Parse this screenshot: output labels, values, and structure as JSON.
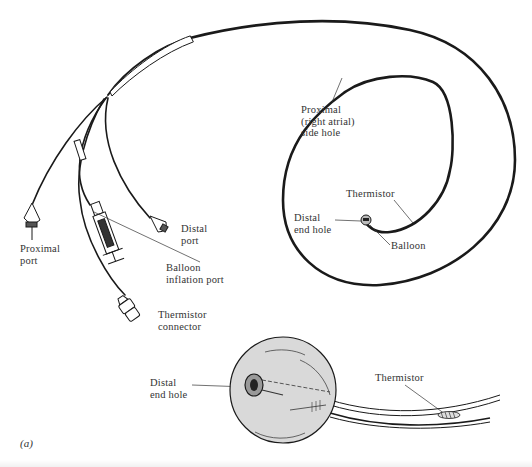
{
  "figure": {
    "label": "(a)"
  },
  "labels": {
    "proximal_port": "Proximal\nport",
    "distal_port": "Distal\nport",
    "balloon_inflation_port": "Balloon\ninflation port",
    "thermistor_connector": "Thermistor\nconnector",
    "proximal_side_hole": "Proximal\n(right atrial)\nside hole",
    "thermistor_top": "Thermistor",
    "distal_end_hole_top": "Distal\nend hole",
    "balloon": "Balloon",
    "distal_end_hole_detail": "Distal\nend hole",
    "thermistor_detail": "Thermistor"
  },
  "colors": {
    "line": "#1a1a1a",
    "balloon_fill": "#d9d9d9",
    "background": "#ffffff"
  }
}
